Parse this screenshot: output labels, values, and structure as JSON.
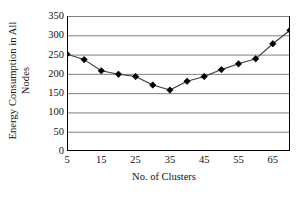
{
  "chart_data": {
    "type": "line",
    "title": "",
    "subtitle": "",
    "xlabel": "No. of Clusters",
    "ylabel_lines": [
      "Energy Consumption in All",
      "Nodes"
    ],
    "ylabel": "Energy Consumption in All Nodes",
    "x": [
      5,
      10,
      15,
      20,
      25,
      30,
      35,
      40,
      45,
      50,
      55,
      60,
      65,
      70
    ],
    "values": [
      251,
      237,
      208,
      199,
      193,
      171,
      158,
      181,
      193,
      211,
      226,
      239,
      278,
      313
    ],
    "series": [
      {
        "name": "Energy Consumption",
        "values": [
          251,
          237,
          208,
          199,
          193,
          171,
          158,
          181,
          193,
          211,
          226,
          239,
          278,
          313
        ]
      }
    ],
    "xlim": [
      5,
      70
    ],
    "ylim": [
      0,
      350
    ],
    "xticks_major": [
      5,
      15,
      25,
      35,
      45,
      55,
      65
    ],
    "xticks_minor": [
      10,
      20,
      30,
      40,
      50,
      60,
      70
    ],
    "xtick_labels": [
      "5",
      "15",
      "25",
      "35",
      "45",
      "55",
      "65"
    ],
    "yticks": [
      0,
      50,
      100,
      150,
      200,
      250,
      300,
      350
    ],
    "ytick_labels": [
      "0",
      "50",
      "100",
      "150",
      "200",
      "250",
      "300",
      "350"
    ],
    "grid": "horizontal",
    "legend": "none",
    "marker": "diamond",
    "marker_color": "#000000",
    "line_color": "#3a3a3a",
    "grid_color": "#808080",
    "axis_color": "#000000",
    "background": "#ffffff"
  }
}
